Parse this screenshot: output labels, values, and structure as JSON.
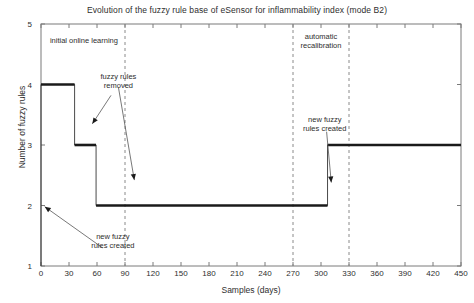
{
  "chart_data": {
    "type": "line",
    "title": "Evolution of the fuzzy rule base of eSensor for inflammability index (mode B2)",
    "xlabel": "Samples (days)",
    "ylabel": "Number of fuzzy rules",
    "xlim": [
      0,
      450
    ],
    "ylim": [
      1,
      5
    ],
    "xticks": [
      0,
      30,
      60,
      90,
      120,
      150,
      180,
      210,
      240,
      270,
      300,
      330,
      360,
      390,
      420,
      450
    ],
    "yticks": [
      1,
      2,
      3,
      4,
      5
    ],
    "grid": false,
    "legend": null,
    "line_color": "#1a1a1a",
    "series": [
      {
        "name": "Number of fuzzy rules",
        "style": "step",
        "x": [
          0,
          0,
          36,
          36,
          59,
          59,
          307,
          307,
          450
        ],
        "values": [
          1,
          4,
          4,
          3,
          3,
          2,
          2,
          3,
          3
        ]
      }
    ],
    "vertical_markers": [
      {
        "x": 90,
        "style": "dashed",
        "color": "#8a8a8a"
      },
      {
        "x": 270,
        "style": "dashed",
        "color": "#8a8a8a"
      },
      {
        "x": 330,
        "style": "dashed",
        "color": "#8a8a8a"
      }
    ],
    "annotations": [
      {
        "id": "initial-online-learning",
        "text": "initial online learning",
        "x": 46,
        "y": 4.72,
        "arrow": false
      },
      {
        "id": "fuzzy-rules-removed",
        "text": "fuzzy rules\nremoved",
        "x": 83,
        "y": 4.06,
        "arrow": true
      },
      {
        "id": "new-fuzzy-rules-created-left",
        "text": "new fuzzy\nrules created",
        "x": 77,
        "y": 1.42,
        "arrow": true
      },
      {
        "id": "automatic-recalibration",
        "text": "automatic\nrecalibration",
        "x": 300,
        "y": 4.72,
        "arrow": false
      },
      {
        "id": "new-fuzzy-rules-created-right",
        "text": "new fuzzy\nrules created",
        "x": 304,
        "y": 3.35,
        "arrow": true
      }
    ]
  },
  "axis": {
    "x_tick_labels": [
      "0",
      "30",
      "60",
      "90",
      "120",
      "150",
      "180",
      "210",
      "240",
      "270",
      "300",
      "330",
      "360",
      "390",
      "420",
      "450"
    ],
    "y_tick_labels": [
      "1",
      "2",
      "3",
      "4",
      "5"
    ]
  },
  "annotation_text": {
    "initial_online_learning": "initial online learning",
    "fuzzy_rules_removed": "fuzzy rules\nremoved",
    "new_fuzzy_rules_created_left": "new fuzzy\nrules created",
    "automatic_recalibration": "automatic\nrecalibration",
    "new_fuzzy_rules_created_right": "new fuzzy\nrules created"
  }
}
